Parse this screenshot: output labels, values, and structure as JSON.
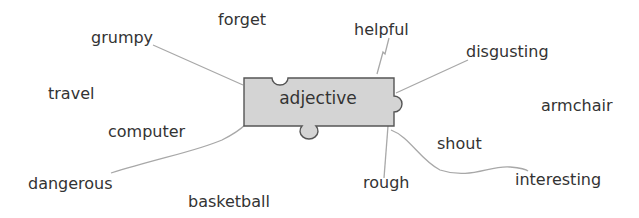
{
  "center": {
    "label": "adjective",
    "fill": "#d4d4d4",
    "stroke": "#555555"
  },
  "line_color": "#a8a8a8",
  "words": [
    {
      "label": "grumpy",
      "x": 91,
      "y": 30
    },
    {
      "label": "forget",
      "x": 218,
      "y": 12
    },
    {
      "label": "helpful",
      "x": 354,
      "y": 22
    },
    {
      "label": "disgusting",
      "x": 466,
      "y": 44
    },
    {
      "label": "travel",
      "x": 48,
      "y": 86
    },
    {
      "label": "armchair",
      "x": 541,
      "y": 98
    },
    {
      "label": "computer",
      "x": 108,
      "y": 124
    },
    {
      "label": "shout",
      "x": 437,
      "y": 136
    },
    {
      "label": "dangerous",
      "x": 28,
      "y": 176
    },
    {
      "label": "interesting",
      "x": 515,
      "y": 172
    },
    {
      "label": "rough",
      "x": 363,
      "y": 175
    },
    {
      "label": "basketball",
      "x": 188,
      "y": 194
    }
  ]
}
